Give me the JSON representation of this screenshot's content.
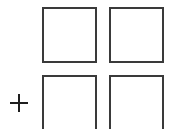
{
  "grid": {
    "border_color": "#3a3a3a",
    "cells": [
      {
        "id": "top-left",
        "x": 42,
        "y": 7,
        "w": 55,
        "h": 56
      },
      {
        "id": "top-right",
        "x": 109,
        "y": 7,
        "w": 55,
        "h": 56
      },
      {
        "id": "bottom-left",
        "x": 42,
        "y": 75,
        "w": 55,
        "h": 60
      },
      {
        "id": "bottom-right",
        "x": 109,
        "y": 75,
        "w": 55,
        "h": 60
      }
    ]
  },
  "add_control": {
    "icon": "plus-icon",
    "color": "#1e1e1e",
    "x": 10,
    "y": 94
  }
}
